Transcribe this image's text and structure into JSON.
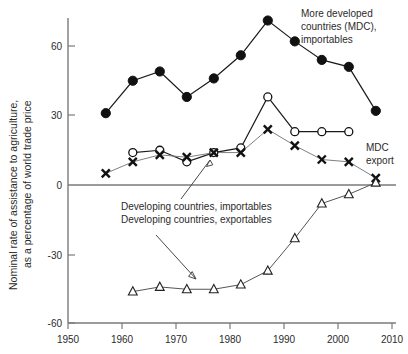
{
  "chart_data": {
    "type": "line",
    "title": "",
    "xlabel": "",
    "ylabel": "Nominal rate of assistance to agriculture, as a percentage of world trade price",
    "xlim": [
      1950,
      2010
    ],
    "ylim": [
      -60,
      75
    ],
    "xticks": [
      1950,
      1960,
      1970,
      1980,
      1990,
      2000,
      2010
    ],
    "yticks": [
      60,
      30,
      0,
      -30,
      -60
    ],
    "xticklabels": [
      "1950",
      "1960",
      "1970",
      "1980",
      "1990",
      "2000",
      "2010"
    ],
    "yticklabels": [
      "60",
      "30",
      "0",
      "-30",
      "-60"
    ],
    "grid": false,
    "legend_position": "inline-annotations",
    "zero_line": 0,
    "series": [
      {
        "name": "More developed countries (MDC), importables",
        "marker": "filled-circle",
        "x": [
          1957,
          1962,
          1967,
          1972,
          1977,
          1982,
          1987,
          1992,
          1997,
          2002,
          2007
        ],
        "values": [
          31,
          45,
          49,
          38,
          46,
          56,
          71,
          62,
          54,
          51,
          32
        ]
      },
      {
        "name": "Developing countries, importables",
        "marker": "open-circle",
        "x": [
          1962,
          1967,
          1972,
          1977,
          1982,
          1987,
          1992,
          1997,
          2002
        ],
        "values": [
          14,
          15,
          10,
          14,
          16,
          38,
          23,
          23,
          23
        ]
      },
      {
        "name": "MDC export",
        "marker": "cross-x",
        "x": [
          1957,
          1962,
          1967,
          1972,
          1977,
          1982,
          1987,
          1992,
          1997,
          2002,
          2007
        ],
        "values": [
          5,
          10,
          13,
          12,
          14,
          14,
          24,
          17,
          11,
          10,
          3
        ]
      },
      {
        "name": "Developing countries, exportables",
        "marker": "open-triangle",
        "x": [
          1962,
          1967,
          1972,
          1977,
          1982,
          1987,
          1992,
          1997,
          2002,
          2007
        ],
        "values": [
          -46,
          -44,
          -45,
          -45,
          -43,
          -37,
          -23,
          -8,
          -4,
          1
        ]
      }
    ],
    "annotations": [
      {
        "id": "mdc-importables",
        "text_lines": [
          "More developed",
          "countries (MDC),",
          "importables"
        ]
      },
      {
        "id": "mdc-export",
        "text_lines": [
          "MDC",
          "export"
        ]
      },
      {
        "id": "developing-importables",
        "text_lines": [
          "Developing countries, importables"
        ]
      },
      {
        "id": "developing-exportables",
        "text_lines": [
          "Developing countries, exportables"
        ]
      }
    ]
  },
  "axis": {
    "y_title": "Nominal rate of assistance to agriculture,",
    "y_title_2": "as a percentage of world trade price",
    "y_labels": {
      "t0": "60",
      "t1": "30",
      "t2": "0",
      "t3": "-30",
      "t4": "-60"
    },
    "x_labels": {
      "t0": "1950",
      "t1": "1960",
      "t2": "1970",
      "t3": "1980",
      "t4": "1990",
      "t5": "2000",
      "t6": "2010"
    }
  },
  "annotations": {
    "mdc_line1": "More developed",
    "mdc_line2": "countries (MDC),",
    "mdc_line3": "importables",
    "mdc_export_line1": "MDC",
    "mdc_export_line2": "export",
    "dev_importables": "Developing countries, importables",
    "dev_exportables": "Developing countries, exportables"
  },
  "colors": {
    "axis": "#7a7a7a",
    "marker_dark": "#111111",
    "line_dark": "#1a1a1a",
    "line_grey": "#808080",
    "text": "#2b2b2b",
    "background": "#ffffff"
  }
}
